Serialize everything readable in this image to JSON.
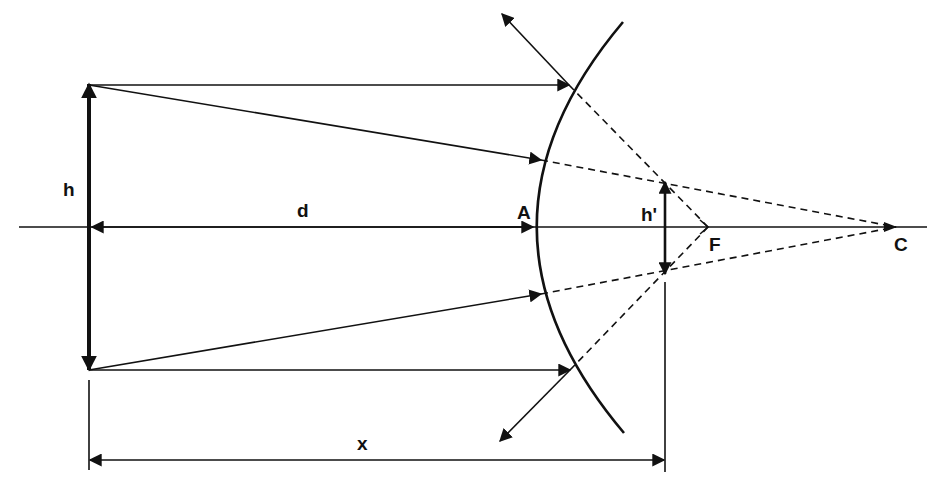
{
  "diagram": {
    "type": "ray-diagram",
    "colors": {
      "ink": "#111111",
      "background": "#ffffff"
    },
    "labels": {
      "object_height": "h",
      "image_height": "h'",
      "object_distance": "d",
      "vertex": "A",
      "focus": "F",
      "center": "C",
      "image_distance_total": "x"
    },
    "elements": {
      "optical_axis": "principal-axis",
      "mirror": "convex-mirror",
      "object": "object-arrow",
      "image": "virtual-image-arrow",
      "rays": [
        "parallel-ray-top",
        "center-ray-top",
        "center-ray-bottom",
        "parallel-ray-bottom"
      ],
      "reflected_rays": [
        "reflected-ray-top",
        "reflected-ray-bottom"
      ],
      "virtual_extensions": [
        "dashed-to-focus-top",
        "dashed-to-center-top",
        "dashed-to-center-bottom",
        "dashed-to-focus-bottom"
      ]
    }
  }
}
